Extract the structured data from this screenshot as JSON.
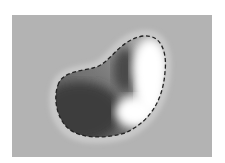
{
  "figure": {
    "background_color": "#ffffff",
    "panel_color": "#b3b3b3",
    "halo_color": "#c6c6c6",
    "outline_color": "#222222",
    "shape": "bean-shaped region",
    "shading": {
      "dark": "#3a3a3a",
      "light": "#ffffff"
    },
    "outline_style": "dashed"
  }
}
